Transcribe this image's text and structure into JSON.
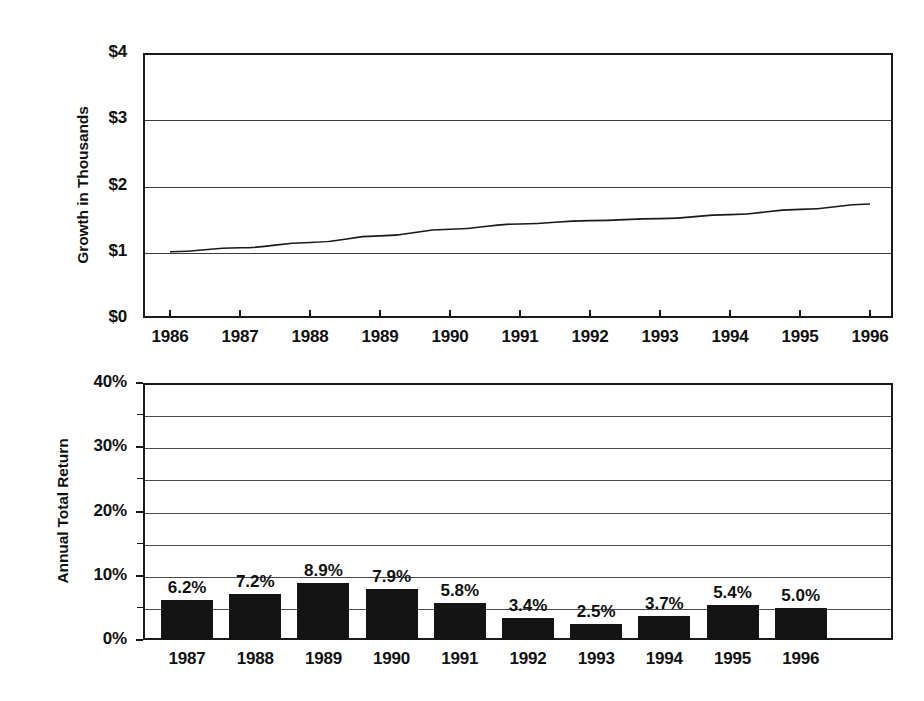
{
  "chart_data": [
    {
      "type": "line",
      "title": "",
      "xlabel": "",
      "ylabel": "Growth in Thousands",
      "x": [
        1986,
        1987,
        1988,
        1989,
        1990,
        1991,
        1992,
        1993,
        1994,
        1995,
        1996
      ],
      "xticklabels": [
        "1986",
        "1987",
        "1988",
        "1989",
        "1990",
        "1991",
        "1992",
        "1993",
        "1994",
        "1995",
        "1996"
      ],
      "values": [
        1.0,
        1.06,
        1.14,
        1.24,
        1.34,
        1.42,
        1.47,
        1.5,
        1.56,
        1.64,
        1.72
      ],
      "yticklabels": [
        "$0",
        "$1",
        "$2",
        "$3",
        "$4"
      ],
      "ytickvalues": [
        0,
        1,
        2,
        3,
        4
      ],
      "ylim": [
        0,
        4
      ],
      "grid": true,
      "legend": "none"
    },
    {
      "type": "bar",
      "title": "",
      "xlabel": "",
      "ylabel": "Annual Total Return",
      "categories": [
        "1987",
        "1988",
        "1989",
        "1990",
        "1991",
        "1992",
        "1993",
        "1994",
        "1995",
        "1996"
      ],
      "values": [
        6.2,
        7.2,
        8.9,
        7.9,
        5.8,
        3.4,
        2.5,
        3.7,
        5.4,
        5.0
      ],
      "datalabels": [
        "6.2%",
        "7.2%",
        "8.9%",
        "7.9%",
        "5.8%",
        "3.4%",
        "2.5%",
        "3.7%",
        "5.4%",
        "5.0%"
      ],
      "yticklabels": [
        "0%",
        "10%",
        "20%",
        "30%",
        "40%"
      ],
      "ytickvalues": [
        0,
        10,
        20,
        30,
        40
      ],
      "gridvalues": [
        0,
        5,
        10,
        15,
        20,
        25,
        30,
        35,
        40
      ],
      "ylim": [
        0,
        40
      ],
      "grid": true,
      "legend": "none",
      "bar_color": "#141414"
    }
  ],
  "line_chart": {
    "y_axis_title": "Growth in Thousands",
    "y_ticks": [
      "$4",
      "$3",
      "$2",
      "$1",
      "$0"
    ],
    "x_ticks": [
      "1986",
      "1987",
      "1988",
      "1989",
      "1990",
      "1991",
      "1992",
      "1993",
      "1994",
      "1995",
      "1996"
    ]
  },
  "bar_chart": {
    "y_axis_title": "Annual Total Return",
    "y_ticks": [
      "40%",
      "30%",
      "20%",
      "10%",
      "0%"
    ],
    "x_ticks": [
      "1987",
      "1988",
      "1989",
      "1990",
      "1991",
      "1992",
      "1993",
      "1994",
      "1995",
      "1996"
    ],
    "bars": [
      {
        "year": "1987",
        "label": "6.2%",
        "value": 6.2
      },
      {
        "year": "1988",
        "label": "7.2%",
        "value": 7.2
      },
      {
        "year": "1989",
        "label": "8.9%",
        "value": 8.9
      },
      {
        "year": "1990",
        "label": "7.9%",
        "value": 7.9
      },
      {
        "year": "1991",
        "label": "5.8%",
        "value": 5.8
      },
      {
        "year": "1992",
        "label": "3.4%",
        "value": 3.4
      },
      {
        "year": "1993",
        "label": "2.5%",
        "value": 2.5
      },
      {
        "year": "1994",
        "label": "3.7%",
        "value": 3.7
      },
      {
        "year": "1995",
        "label": "5.4%",
        "value": 5.4
      },
      {
        "year": "1996",
        "label": "5.0%",
        "value": 5.0
      }
    ]
  }
}
